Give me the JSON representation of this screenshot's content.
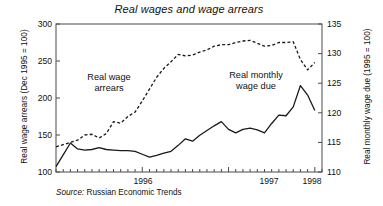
{
  "chart_data": {
    "type": "line",
    "title": "Real wages and wage arrears",
    "source": "Russian Economic Trends",
    "source_prefix": "Source:",
    "xlabel": "",
    "x_tick_labels": [
      "1996",
      "1997",
      "1998"
    ],
    "x_tick_positions": [
      12,
      24,
      36
    ],
    "x_minor_ticks_per_year": 12,
    "xlim": [
      0,
      37
    ],
    "grid": false,
    "legend": "inline-annotations",
    "left_axis": {
      "label": "Real wage arrears (Dec 1995 = 100)",
      "ylim": [
        100,
        300
      ],
      "ticks": [
        100,
        150,
        200,
        250,
        300
      ]
    },
    "right_axis": {
      "label": "Real monthly wage due (1995 = 100)",
      "ylim": [
        110,
        135
      ],
      "ticks": [
        110,
        115,
        120,
        125,
        130,
        135
      ]
    },
    "series": [
      {
        "name": "Real wage arrears",
        "axis": "left",
        "style": "dashed",
        "color": "#1a1a1a",
        "annotation": "Real wage\narrears",
        "annotation_line1": "Real wage",
        "annotation_line2": "arrears",
        "x": [
          0,
          1,
          2,
          3,
          4,
          5,
          6,
          7,
          8,
          9,
          10,
          11,
          12,
          13,
          14,
          15,
          16,
          17,
          18,
          19,
          20,
          21,
          22,
          23,
          24,
          25,
          26,
          27,
          28,
          29,
          30,
          31,
          32,
          33,
          34,
          35,
          36
        ],
        "values": [
          134,
          137,
          140,
          143,
          150,
          151,
          146,
          152,
          168,
          166,
          175,
          181,
          196,
          212,
          228,
          240,
          249,
          259,
          257,
          258,
          262,
          265,
          270,
          272,
          272,
          275,
          277,
          278,
          274,
          270,
          271,
          275,
          275,
          276,
          252,
          238,
          248
        ]
      },
      {
        "name": "Real monthly wage due",
        "axis": "right",
        "style": "solid",
        "color": "#1a1a1a",
        "annotation": "Real monthly\nwage due",
        "annotation_line1": "Real monthly",
        "annotation_line2": "wage due",
        "x": [
          0,
          1,
          2,
          3,
          4,
          5,
          6,
          7,
          8,
          9,
          10,
          11,
          12,
          13,
          14,
          15,
          16,
          17,
          18,
          19,
          20,
          21,
          22,
          23,
          24,
          25,
          26,
          27,
          28,
          29,
          30,
          31,
          32,
          33,
          34,
          35,
          36
        ],
        "values": [
          110.9,
          112.9,
          114.9,
          113.9,
          113.7,
          113.8,
          114.1,
          113.8,
          113.7,
          113.6,
          113.6,
          113.5,
          113.0,
          112.5,
          112.8,
          113.2,
          113.5,
          114.5,
          115.6,
          115.2,
          116.2,
          117.0,
          117.8,
          118.5,
          117.2,
          116.6,
          117.2,
          117.4,
          117.1,
          116.6,
          118.2,
          119.6,
          119.5,
          121.0,
          124.6,
          123.0,
          120.4
        ]
      }
    ]
  },
  "plot_frame": {
    "left": 56,
    "top": 24,
    "right": 322,
    "bottom": 172
  }
}
